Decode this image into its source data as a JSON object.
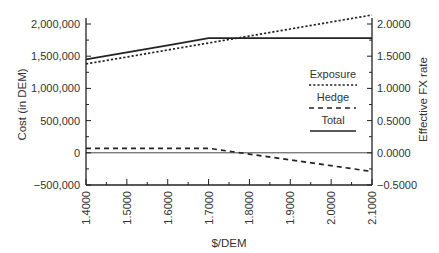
{
  "chart_data": {
    "type": "line",
    "title": "",
    "xlabel": "$/DEM",
    "ylabel": "Cost (in DEM)",
    "y2label": "Effective FX rate",
    "x": [
      1.4,
      1.5,
      1.6,
      1.7,
      1.8,
      1.9,
      2.0,
      2.1
    ],
    "x_tick_labels": [
      "1.4000",
      "1.5000",
      "1.6000",
      "1.7000",
      "1.8000",
      "1.9000",
      "2.0000",
      "2.1000"
    ],
    "y_tick_labels": [
      "2,000,000",
      "1,500,000",
      "1,000,000",
      "500,000",
      "0",
      "−500,000"
    ],
    "y2_tick_labels": [
      "2.0000",
      "1.5000",
      "1.0000",
      "0.5000",
      "0.0000",
      "−0.5000"
    ],
    "ylim": [
      -500000,
      2000000
    ],
    "y2lim": [
      -0.5,
      2.0
    ],
    "xlim": [
      1.4,
      2.1
    ],
    "grid": false,
    "legend_position": "inside right, center",
    "series": [
      {
        "name": "Exposure",
        "style": "dotted",
        "values": [
          1380000,
          1488000,
          1597000,
          1705000,
          1814000,
          1922000,
          2031000,
          2140000
        ]
      },
      {
        "name": "Hedge",
        "style": "dashed",
        "values": [
          70000,
          70000,
          70000,
          70000,
          -20000,
          -110000,
          -200000,
          -290000
        ]
      },
      {
        "name": "Total",
        "style": "solid",
        "values": [
          1450000,
          1560000,
          1670000,
          1780000,
          1780000,
          1780000,
          1780000,
          1780000
        ]
      }
    ],
    "reference_lines": [
      {
        "y": 0,
        "style": "thin solid"
      }
    ]
  },
  "legend": {
    "exposure": "Exposure",
    "hedge": "Hedge",
    "total": "Total"
  }
}
